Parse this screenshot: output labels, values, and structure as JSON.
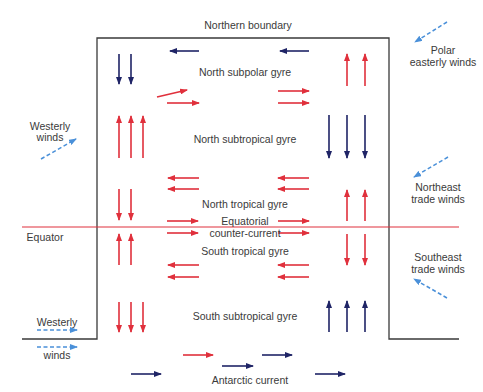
{
  "diagram": {
    "colors": {
      "warm_current": "#e0303c",
      "cold_current": "#1f2466",
      "wind": "#4a90d9",
      "boundary": "#3a3a3a",
      "equator": "#e0303c",
      "text": "#3a3a3a"
    },
    "labels": {
      "northern_boundary": "Northern boundary",
      "north_subpolar_gyre": "North subpolar gyre",
      "north_subtropical_gyre": "North subtropical gyre",
      "north_tropical_gyre": "North tropical gyre",
      "equatorial_line1": "Equatorial",
      "equatorial_line2": "counter-current",
      "south_tropical_gyre": "South tropical gyre",
      "south_subtropical_gyre": "South subtropical gyre",
      "antarctic_current": "Antarctic current",
      "equator": "Equator"
    },
    "winds": {
      "polar_easterly_line1": "Polar",
      "polar_easterly_line2": "easterly winds",
      "westerly_north_line1": "Westerly",
      "westerly_north_line2": "winds",
      "northeast_trade_line1": "Northeast",
      "northeast_trade_line2": "trade winds",
      "southeast_trade_line1": "Southeast",
      "southeast_trade_line2": "trade winds",
      "westerly_south_line1": "Westerly",
      "westerly_south_line2": "winds"
    }
  }
}
